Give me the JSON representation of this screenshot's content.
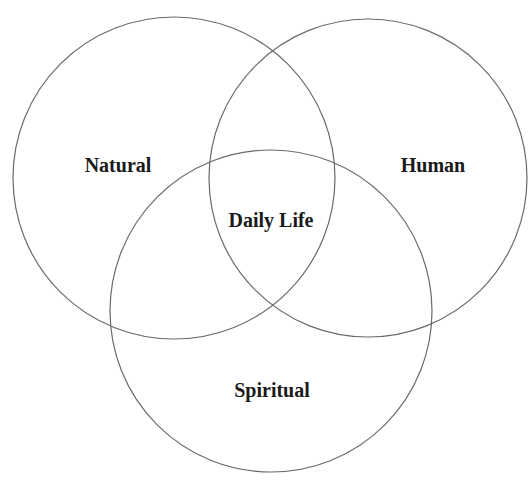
{
  "diagram": {
    "type": "venn",
    "sets": [
      {
        "id": "natural",
        "label": "Natural",
        "cx": 174,
        "cy": 178,
        "r": 161,
        "label_x": 118,
        "label_y": 165
      },
      {
        "id": "human",
        "label": "Human",
        "cx": 368,
        "cy": 178,
        "r": 159,
        "label_x": 433,
        "label_y": 165
      },
      {
        "id": "spiritual",
        "label": "Spiritual",
        "cx": 271,
        "cy": 311,
        "r": 161,
        "label_x": 272,
        "label_y": 390
      }
    ],
    "intersection": {
      "label": "Daily Life",
      "label_x": 271,
      "label_y": 220
    },
    "stroke_color": "#6a6a6a",
    "text_color": "#1a1a1a",
    "background": "#ffffff"
  }
}
